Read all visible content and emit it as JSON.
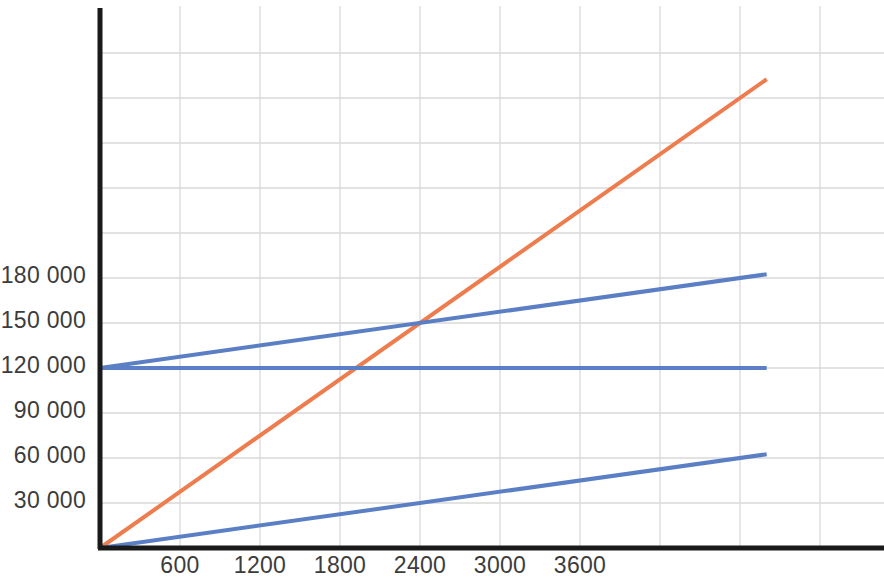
{
  "chart_data": {
    "type": "line",
    "title": "",
    "xlabel": "",
    "ylabel": "",
    "xlim": [
      0,
      5880
    ],
    "ylim": [
      0,
      345000
    ],
    "grid": true,
    "legend": "none",
    "x_ticks": [
      {
        "value": 600,
        "label": "600"
      },
      {
        "value": 1200,
        "label": "1200"
      },
      {
        "value": 1800,
        "label": "1800"
      },
      {
        "value": 2400,
        "label": "2400"
      },
      {
        "value": 3000,
        "label": "3000"
      },
      {
        "value": 3600,
        "label": "3600"
      }
    ],
    "y_ticks": [
      {
        "value": 30000,
        "label": "30 000"
      },
      {
        "value": 60000,
        "label": "60 000"
      },
      {
        "value": 90000,
        "label": "90 000"
      },
      {
        "value": 120000,
        "label": "120 000"
      },
      {
        "value": 150000,
        "label": "150 000"
      },
      {
        "value": 180000,
        "label": "180 000"
      }
    ],
    "gridlines": {
      "x": [
        600,
        1200,
        1800,
        2400,
        3000,
        3600,
        4200,
        4800,
        5400
      ],
      "y": [
        30000,
        60000,
        90000,
        120000,
        150000,
        180000,
        210000,
        240000,
        270000,
        300000,
        330000
      ]
    },
    "series": [
      {
        "name": "orange-line",
        "color": "#ED7D4E",
        "x": [
          0,
          5000
        ],
        "y": [
          0,
          312500
        ],
        "intercept": 0,
        "slope": 62.5
      },
      {
        "name": "blue-rising-line",
        "color": "#5B7FC4",
        "x": [
          0,
          5000
        ],
        "y": [
          120000,
          182500
        ],
        "intercept": 120000,
        "slope": 12.5
      },
      {
        "name": "blue-flat-line",
        "color": "#5B7FC4",
        "x": [
          0,
          5000
        ],
        "y": [
          120000,
          120000
        ],
        "intercept": 120000,
        "slope": 0
      },
      {
        "name": "blue-lower-line",
        "color": "#5B7FC4",
        "x": [
          0,
          5000
        ],
        "y": [
          0,
          62500
        ],
        "intercept": 0,
        "slope": 12.5
      }
    ],
    "annotations": [
      {
        "name": "intersection-orange-blue-rising",
        "x": 2400,
        "y": 150000
      },
      {
        "name": "intersection-orange-blue-flat",
        "x": 1920,
        "y": 120000
      }
    ],
    "axis_color": "#1a1a1a",
    "grid_color": "#d9d9d9"
  }
}
